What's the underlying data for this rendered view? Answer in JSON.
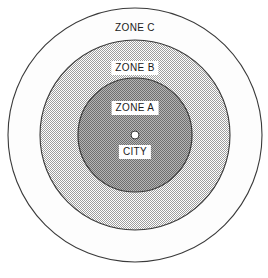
{
  "diagram": {
    "background_color": "#ffffff",
    "center": {
      "x": 135,
      "y": 135
    },
    "outline_color": "#3a3a3a",
    "rings": [
      {
        "id": "zone-c",
        "label": "ZONE C",
        "radius": 127,
        "fill_color": "#fdfdfd",
        "pattern": "none",
        "label_boxed": false,
        "label_x": 135,
        "label_y": 27
      },
      {
        "id": "zone-b",
        "label": "ZONE B",
        "radius": 95,
        "fill_color": "#cccccc",
        "pattern": "light-dither",
        "label_boxed": true,
        "label_x": 135,
        "label_y": 68
      },
      {
        "id": "zone-a",
        "label": "ZONE A",
        "radius": 57,
        "fill_color": "#9a9a9a",
        "pattern": "mid-dither",
        "label_boxed": true,
        "label_x": 135,
        "label_y": 108
      }
    ],
    "city_marker": {
      "label": "CITY",
      "radius": 4,
      "fill_color": "#ffffff",
      "outline_color": "#3a3a3a",
      "marker_x": 135,
      "marker_y": 135,
      "label_boxed": true,
      "label_x": 135,
      "label_y": 152
    }
  }
}
